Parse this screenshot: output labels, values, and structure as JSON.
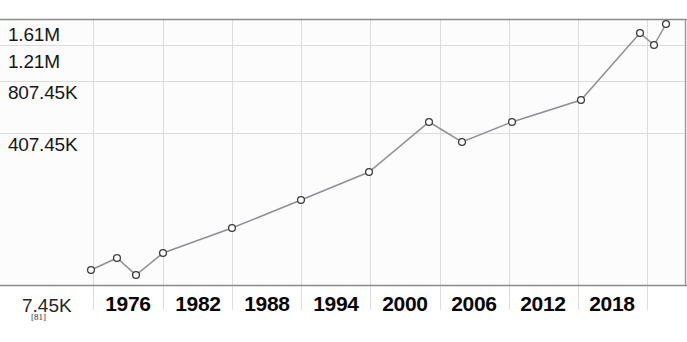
{
  "chart_data": {
    "type": "line",
    "title": "",
    "xlabel": "",
    "ylabel": "",
    "x_tick_labels": [
      "1976",
      "1982",
      "1988",
      "1994",
      "2000",
      "2006",
      "2012",
      "2018"
    ],
    "y_tick_labels": [
      "1.61M",
      "1.21M",
      "807.45K",
      "407.45K",
      "7.45K"
    ],
    "y_tick_values": [
      1610000,
      1210000,
      807450,
      407450,
      7450
    ],
    "ylim": [
      7450,
      1610000
    ],
    "xlim": [
      1973,
      2022
    ],
    "grid": true,
    "legend": null,
    "markers": "open-circle",
    "line_color": "#8f8f96",
    "marker_color": "#3a3a3a",
    "x": [
      1974,
      1976,
      1977,
      1979,
      1982,
      1988,
      1994,
      1998,
      2002,
      2005,
      2009,
      2014,
      2019,
      2020,
      2021
    ],
    "values": [
      79000,
      130000,
      62000,
      143000,
      235000,
      340000,
      437000,
      560000,
      905000,
      707000,
      905000,
      1010000,
      1465000,
      1370000,
      1545000
    ],
    "points": [
      {
        "x": 1974,
        "px": 91,
        "py": 270,
        "label": "79K"
      },
      {
        "x": 1976,
        "px": 117,
        "py": 258,
        "label": "130K"
      },
      {
        "x": 1977,
        "px": 136,
        "py": 275,
        "label": "62K"
      },
      {
        "x": 1979,
        "px": 163,
        "py": 253,
        "label": "143K"
      },
      {
        "x": 1982,
        "px": 232,
        "py": 228,
        "label": "235K"
      },
      {
        "x": 1988,
        "px": 301,
        "py": 200,
        "label": "340K"
      },
      {
        "x": 1994,
        "px": 369,
        "py": 172,
        "label": "437K"
      },
      {
        "x": 1998,
        "px": 429,
        "py": 122,
        "label": "560K"
      },
      {
        "x": 2002,
        "px": 462,
        "py": 142,
        "label": "905K"
      },
      {
        "x": 2005,
        "px": 512,
        "py": 122,
        "label": "707K"
      },
      {
        "x": 2009,
        "px": 581,
        "py": 100,
        "label": "905K"
      },
      {
        "x": 2014,
        "px": 640,
        "py": 33,
        "label": "1.01M"
      },
      {
        "x": 2019,
        "px": 654,
        "py": 45,
        "label": "1.465M"
      },
      {
        "x": 2020,
        "px": 666,
        "py": 24,
        "label": "1.37M"
      }
    ]
  },
  "axes": {
    "y_labels": [
      {
        "text": "1.61M",
        "top": 24
      },
      {
        "text": "1.21M",
        "top": 51
      },
      {
        "text": "807.45K",
        "top": 82
      },
      {
        "text": "407.45K",
        "top": 134
      },
      {
        "text": "7.45K",
        "top": 295
      }
    ],
    "x_labels": [
      {
        "text": "1976",
        "center": 128
      },
      {
        "text": "1982",
        "center": 198
      },
      {
        "text": "1988",
        "center": 267
      },
      {
        "text": "1994",
        "center": 336
      },
      {
        "text": "2000",
        "center": 405
      },
      {
        "text": "2006",
        "center": 474
      },
      {
        "text": "2012",
        "center": 543
      },
      {
        "text": "2018",
        "center": 612
      }
    ]
  },
  "footnote": {
    "citation": "[81]"
  },
  "colors": {
    "line": "#8f8f96",
    "marker_stroke": "#3a3a3a",
    "marker_fill": "#ffffff",
    "grid": "#dcdcdc",
    "axis": "#7a7a7a",
    "plot_bg": "#fdfdfd",
    "text": "#111111"
  }
}
